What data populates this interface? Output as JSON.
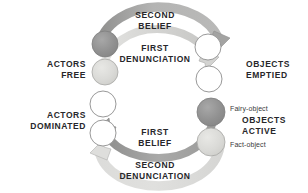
{
  "figure": {
    "type": "cycle-diagram",
    "title": "",
    "background": "#ffffff",
    "colors": {
      "dark_gray": "#8e8e90",
      "mid_gray": "#b9b9ba",
      "light_gray": "#d8d8d6",
      "white_fill": "#ffffff",
      "outline": "#8c8c8e",
      "text": "#27272a"
    },
    "axis_labels": {
      "actors_free": "ACTORS\nFREE",
      "actors_dominated": "ACTORS\nDOMINATED",
      "objects_emptied": "OBJECTS\nEMPTIED",
      "objects_active": "OBJECTS\nACTIVE"
    },
    "arc_labels": {
      "second_belief": "SECOND\nBELIEF",
      "first_denunciation": "FIRST\nDENUNCIATION",
      "first_belief": "FIRST\nBELIEF",
      "second_denunciation": "SECOND\nDENUNCIATION"
    },
    "annotations": {
      "fairy_object": "Fairy-object",
      "fact_object": "Fact-object"
    },
    "nodes_left": [
      {
        "name": "left-node-1",
        "fill": "dark_gray",
        "cx": 105,
        "cy": 44,
        "r": 13
      },
      {
        "name": "left-node-2",
        "fill": "light_gray",
        "cx": 105,
        "cy": 72,
        "r": 13
      },
      {
        "name": "left-node-3",
        "fill": "white_fill",
        "cx": 103,
        "cy": 104,
        "r": 13
      },
      {
        "name": "left-node-4",
        "fill": "white_fill",
        "cx": 103,
        "cy": 133,
        "r": 13
      }
    ],
    "nodes_right": [
      {
        "name": "right-node-1",
        "fill": "white_fill",
        "cx": 208,
        "cy": 47,
        "r": 13
      },
      {
        "name": "right-node-2",
        "fill": "white_fill",
        "cx": 209,
        "cy": 79,
        "r": 13
      },
      {
        "name": "right-node-3",
        "fill": "dark_gray",
        "cx": 211,
        "cy": 112,
        "r": 14
      },
      {
        "name": "right-node-4",
        "fill": "light_gray",
        "cx": 211,
        "cy": 142,
        "r": 14
      }
    ],
    "arcs": [
      {
        "name": "second-belief-arc",
        "direction": "left-to-right",
        "position": "outer-top",
        "shade": "dark_gray"
      },
      {
        "name": "first-denunciation-arc",
        "direction": "left-to-right",
        "position": "inner-top",
        "shade": "light_gray"
      },
      {
        "name": "first-belief-arc",
        "direction": "right-to-left",
        "position": "inner-bottom",
        "shade": "dark_gray"
      },
      {
        "name": "second-denunciation-arc",
        "direction": "right-to-left",
        "position": "outer-bottom",
        "shade": "light_gray"
      }
    ]
  }
}
